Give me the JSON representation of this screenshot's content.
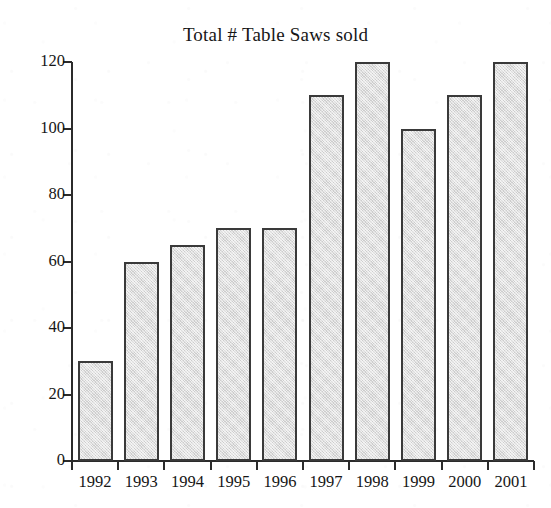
{
  "chart_data": {
    "type": "bar",
    "title": "Total # Table Saws sold",
    "xlabel": "",
    "ylabel": "",
    "categories": [
      "1992",
      "1993",
      "1994",
      "1995",
      "1996",
      "1997",
      "1998",
      "1999",
      "2000",
      "2001"
    ],
    "values": [
      30,
      60,
      65,
      70,
      70,
      110,
      120,
      100,
      110,
      120
    ],
    "series": [
      {
        "name": "Total # Table Saws sold",
        "values": [
          30,
          60,
          65,
          70,
          70,
          110,
          120,
          100,
          110,
          120
        ]
      }
    ],
    "ylim": [
      0,
      120
    ],
    "xlim": null,
    "y_ticks": [
      0,
      20,
      40,
      60,
      80,
      100,
      120
    ],
    "y_tick_labels": [
      "0",
      "20",
      "40",
      "60",
      "80",
      "100",
      "120"
    ],
    "x_tick_labels": [
      "1992",
      "1993",
      "1994",
      "1995",
      "1996",
      "1997",
      "1998",
      "1999",
      "2000",
      "2001"
    ],
    "grid": false,
    "legend": null,
    "legend_position": "none",
    "annotations": [],
    "bar_fill_color": "#d9d9d9",
    "bar_border_color": "#3a3a3a",
    "axis_color": "#2b2b2b",
    "background_color": "#ffffff"
  }
}
